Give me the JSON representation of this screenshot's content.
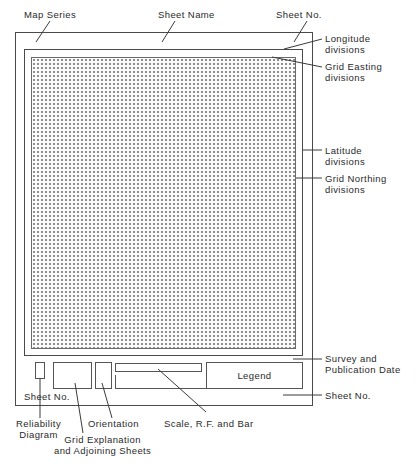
{
  "diagram": {
    "labels": {
      "map_series": "Map Series",
      "sheet_name": "Sheet Name",
      "sheet_no_top": "Sheet No.",
      "longitude_divisions": [
        "Longitude",
        "divisions"
      ],
      "grid_easting_divisions": [
        "Grid  Easting",
        "divisions"
      ],
      "latitude_divisions": [
        "Latitude",
        "divisions"
      ],
      "grid_northing_divisions": [
        "Grid  Northing",
        "divisions"
      ],
      "survey_publication_date": [
        "Survey  and",
        "Publication  Date"
      ],
      "sheet_no_bottom_right": "Sheet  No.",
      "sheet_no_bottom_left": "Sheet  No.",
      "reliability_diagram": [
        "Reliability",
        "Diagram"
      ],
      "orientation": "Orientation",
      "scale_rf_bar": "Scale,  R.F.  and  Bar",
      "grid_explanation": [
        "Grid  Explanation",
        "and  Adjoining  Sheets"
      ],
      "legend": "Legend"
    },
    "colors": {
      "line": "#4a4a4a",
      "dot": "#8a8a8a",
      "background": "#ffffff"
    }
  }
}
